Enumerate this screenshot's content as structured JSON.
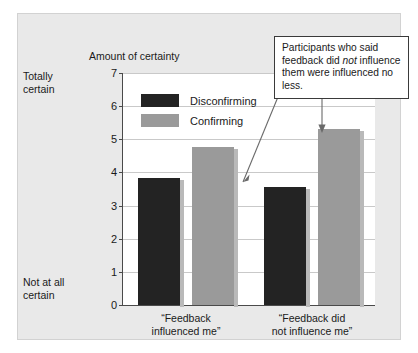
{
  "chart_data": {
    "type": "bar",
    "title": "Amount of certainty",
    "xlabel": "",
    "ylabel": "Amount of certainty",
    "ylim": [
      0,
      7
    ],
    "yticks": [
      0,
      1,
      2,
      3,
      4,
      5,
      6,
      7
    ],
    "ytick_labels": [
      "0",
      "1",
      "2",
      "3",
      "4",
      "5",
      "6",
      "7"
    ],
    "y_axis_high_label": "Totally\ncertain",
    "y_axis_low_label": "Not at all\ncertain",
    "grid": true,
    "legend_position": "upper-left-inside",
    "categories": [
      "“Feedback influenced me”",
      "“Feedback did not influence me”"
    ],
    "category_labels": [
      [
        "“Feedback",
        "influenced me”"
      ],
      [
        "“Feedback did",
        "not influence me”"
      ]
    ],
    "series": [
      {
        "name": "Disconfirming",
        "color": "#232323",
        "values": [
          3.82,
          3.55
        ]
      },
      {
        "name": "Confirming",
        "color": "#9a9a9a",
        "values": [
          4.78,
          5.3
        ]
      }
    ],
    "annotations": [
      {
        "text": "Participants who said feedback did not influence them were influenced no less.",
        "emphasis_word": "not",
        "points_to": [
          "Disconfirming bar, “Feedback did not influence me”",
          "Confirming bar, “Feedback did not influence me”"
        ]
      }
    ]
  },
  "figure": {
    "axis_title": "Amount of certainty",
    "top_label_line1": "Totally",
    "top_label_line2": "certain",
    "bottom_label_line1": "Not at all",
    "bottom_label_line2": "certain",
    "legend": [
      {
        "label": "Disconfirming"
      },
      {
        "label": "Confirming"
      }
    ],
    "callout": {
      "part1": "Participants who said feedback did ",
      "emphasis": "not",
      "part2": " influence them were influenced no less."
    },
    "colors": {
      "disconfirming": "#232323",
      "confirming": "#9a9a9a",
      "panel_background": "#e9e9e9",
      "plot_background": "#ffffff",
      "axis": "#4a4a4a",
      "gridline": "#c9c9c9"
    }
  }
}
